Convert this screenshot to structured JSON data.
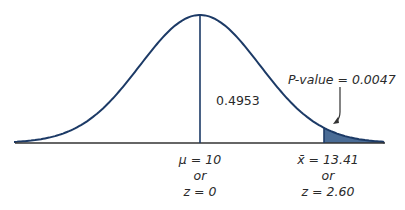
{
  "diagram": {
    "type": "normal-distribution",
    "colors": {
      "curve": "#1c3a66",
      "shade": "#4a6c96",
      "axis": "#333333",
      "text": "#2a2a2a"
    },
    "labels": {
      "center_area": "0.4953",
      "p_value": "P-value = 0.0047",
      "mean_line1": "μ = 10",
      "mean_line2": "or",
      "mean_line3": "z = 0",
      "xbar_line1": "x̄ = 13.41",
      "xbar_line2": "or",
      "xbar_line3": "z = 2.60"
    }
  }
}
